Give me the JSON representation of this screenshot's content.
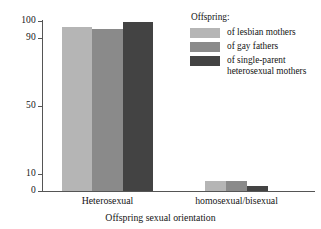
{
  "chart_data": {
    "type": "bar",
    "title": "",
    "xlabel": "Offspring sexual orientation",
    "ylabel": "",
    "categories": [
      "Heterosexual",
      "homosexual/bisexual"
    ],
    "series": [
      {
        "name": "of lesbian mothers",
        "color": "#b5b5b5",
        "values": [
          96,
          6
        ]
      },
      {
        "name": "of gay fathers",
        "color": "#8a8a8a",
        "values": [
          95,
          6
        ]
      },
      {
        "name": "of single-parent heterosexual mothers",
        "color": "#434343",
        "values": [
          99,
          3
        ]
      }
    ],
    "ylim": [
      0,
      100
    ],
    "yticks": [
      0,
      10,
      50,
      90,
      100
    ],
    "ytick_labels": [
      "0",
      "10",
      "50",
      "90",
      "100"
    ],
    "grid": false,
    "legend_position": "upper-right"
  },
  "legend": {
    "title": "Offspring:",
    "entries": [
      {
        "label": "of lesbian mothers",
        "color": "#b5b5b5"
      },
      {
        "label": "of gay fathers",
        "color": "#8a8a8a"
      },
      {
        "label": "of single-parent heterosexual mothers",
        "color": "#434343"
      }
    ]
  },
  "axes": {
    "x_title": "Offspring sexual orientation",
    "x_categories": [
      "Heterosexual",
      "homosexual/bisexual"
    ],
    "y_tick_labels": [
      "100",
      "90",
      "50",
      "10",
      "0"
    ]
  },
  "colors": {
    "axis": "#555555",
    "text": "#141414",
    "background": "#ffffff"
  }
}
